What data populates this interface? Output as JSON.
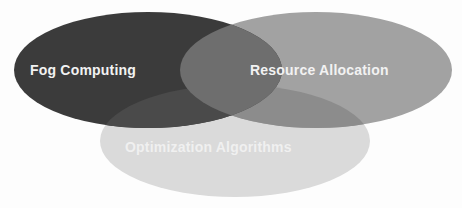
{
  "diagram": {
    "type": "venn",
    "sets": [
      {
        "id": "fog",
        "label": "Fog Computing",
        "color": "#3b3b3b",
        "cx": 148,
        "cy": 70,
        "rx": 134,
        "ry": 58,
        "label_x": 30,
        "label_y": 75
      },
      {
        "id": "resource",
        "label": "Resource Allocation",
        "color": "#a2a2a2",
        "cx": 316,
        "cy": 70,
        "rx": 136,
        "ry": 58,
        "label_x": 250,
        "label_y": 75
      },
      {
        "id": "optimization",
        "label": "Optimization Algorithms",
        "color": "#dadada",
        "cx": 235,
        "cy": 141,
        "rx": 135,
        "ry": 56,
        "label_x": 125,
        "label_y": 152
      }
    ],
    "overlap_fog_resource_color": "#6e6e6e",
    "overlap_fog_optimization_color": "#4a4a4a",
    "overlap_resource_optimization_color": "#8c8c8c"
  }
}
